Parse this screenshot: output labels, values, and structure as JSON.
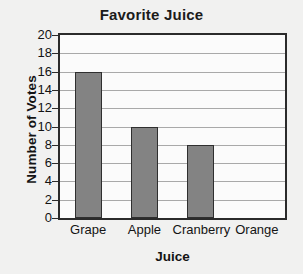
{
  "chart_data": {
    "type": "bar",
    "title": "Favorite Juice",
    "xlabel": "Juice",
    "ylabel": "Number of Votes",
    "categories": [
      "Grape",
      "Apple",
      "Cranberry",
      "Orange"
    ],
    "values": [
      16,
      10,
      8,
      0
    ],
    "ylim": [
      0,
      20
    ],
    "ytick_step": 2,
    "yticks": [
      20,
      18,
      16,
      14,
      12,
      10,
      8,
      6,
      4,
      2,
      0
    ],
    "grid": "horizontal",
    "legend": "none",
    "colors": {
      "bar_fill": "#838383",
      "bar_border": "#2f2f2f",
      "gridline": "#a9a9a9",
      "frame": "#2b2b2b",
      "plot_background": "#fbfbfb",
      "page_background": "#f1f1f0",
      "text": "#141414"
    }
  }
}
